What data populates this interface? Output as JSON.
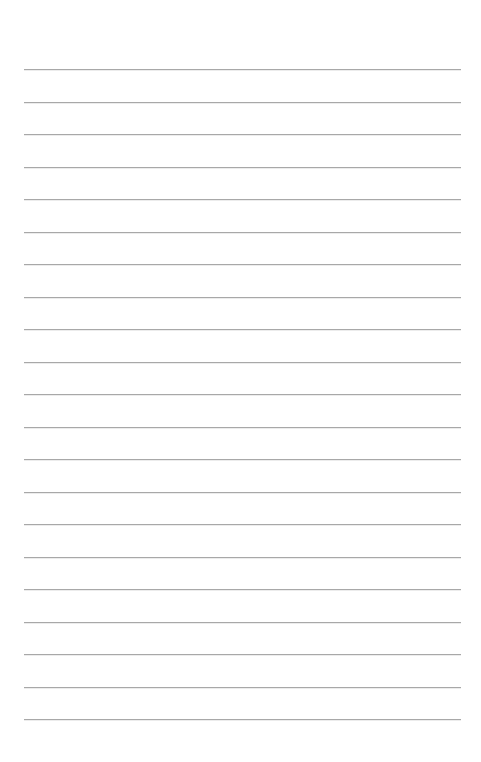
{
  "page": {
    "type": "lined-paper",
    "background_color": "#ffffff",
    "rule_color": "#a8a8a8",
    "rule_count": 21,
    "rule_left": 24,
    "rule_right": 461,
    "first_rule_y": 69,
    "rule_spacing": 32.5
  }
}
